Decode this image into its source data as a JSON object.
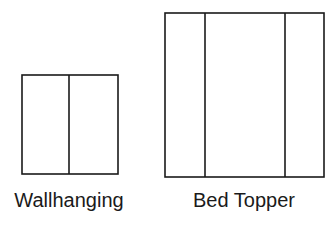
{
  "diagram": {
    "panels": [
      {
        "label": "Wallhanging",
        "rect": {
          "x": 22,
          "y": 75,
          "w": 96,
          "h": 99
        },
        "dividers_x": [
          69
        ]
      },
      {
        "label": "Bed Topper",
        "rect": {
          "x": 165,
          "y": 13,
          "w": 159,
          "h": 164
        },
        "dividers_x": [
          205,
          285
        ]
      }
    ],
    "stroke_color": "#1a1a1a",
    "background": "#ffffff"
  }
}
